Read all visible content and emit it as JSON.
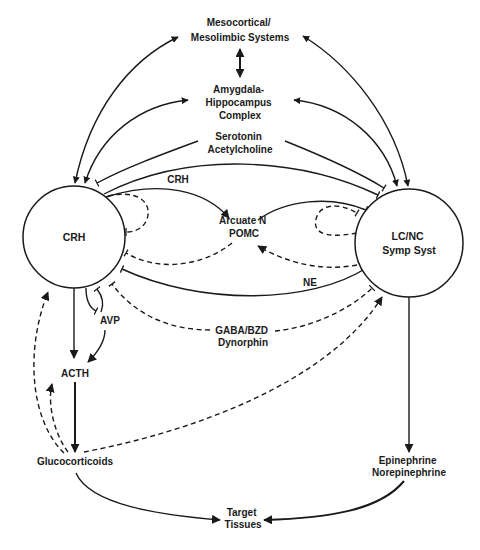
{
  "diagram": {
    "type": "stress-system-neuroendocrine-pathways",
    "nodes": {
      "mesocortical": {
        "lines": [
          "Mesocortical/",
          "Mesolimbic Systems"
        ]
      },
      "amygdala": {
        "lines": [
          "Amygdala-",
          "Hippocampus",
          "Complex"
        ]
      },
      "serotonin": {
        "lines": [
          "Serotonin",
          "Acetylcholine"
        ]
      },
      "crh_center": {
        "lines": [
          "CRH"
        ]
      },
      "lcnc": {
        "lines": [
          "LC/NC",
          "Symp Syst"
        ]
      },
      "arcuate": {
        "lines": [
          "Arcuate N",
          "POMC"
        ]
      },
      "gaba": {
        "lines": [
          "GABA/BZD",
          "Dynorphin"
        ]
      },
      "avp": {
        "lines": [
          "AVP"
        ]
      },
      "acth": {
        "lines": [
          "ACTH"
        ]
      },
      "glucocorticoids": {
        "lines": [
          "Glucocorticoids"
        ]
      },
      "epinephrine": {
        "lines": [
          "Epinephrine",
          "Norepinephrine"
        ]
      },
      "target": {
        "lines": [
          "Target",
          "Tissues"
        ]
      }
    },
    "edge_labels": {
      "crh": "CRH",
      "ne": "NE"
    },
    "edges": [
      {
        "from": "CRH",
        "to": "Mesocortical/Mesolimbic Systems",
        "style": "solid",
        "head": "arrow-both"
      },
      {
        "from": "CRH",
        "to": "Amygdala-Hippocampus Complex",
        "style": "solid",
        "head": "arrow-both"
      },
      {
        "from": "LC/NC Symp Syst",
        "to": "Mesocortical/Mesolimbic Systems",
        "style": "solid",
        "head": "arrow-both"
      },
      {
        "from": "LC/NC Symp Syst",
        "to": "Amygdala-Hippocampus Complex",
        "style": "solid",
        "head": "arrow-both"
      },
      {
        "from": "Mesocortical/Mesolimbic Systems",
        "to": "Amygdala-Hippocampus Complex",
        "style": "solid",
        "head": "arrow-both"
      },
      {
        "from": "Serotonin Acetylcholine",
        "to": "CRH",
        "style": "solid",
        "head": "stimulate"
      },
      {
        "from": "Serotonin Acetylcholine",
        "to": "LC/NC Symp Syst",
        "style": "solid",
        "head": "stimulate"
      },
      {
        "from": "CRH",
        "to": "LC/NC Symp Syst",
        "style": "solid",
        "head": "mutual"
      },
      {
        "from": "CRH",
        "to": "Arcuate N POMC",
        "label": "CRH",
        "style": "solid",
        "head": "arrow"
      },
      {
        "from": "Arcuate N POMC",
        "to": "CRH",
        "style": "dashed",
        "head": "inhibit"
      },
      {
        "from": "Arcuate N POMC",
        "to": "LC/NC Symp Syst",
        "style": "solid",
        "head": "inhibit"
      },
      {
        "from": "LC/NC Symp Syst",
        "to": "Arcuate N POMC",
        "label": "NE",
        "style": "dashed",
        "head": "arrow"
      },
      {
        "from": "LC/NC Symp Syst",
        "to": "CRH",
        "label": "NE",
        "style": "solid",
        "head": "inhibit"
      },
      {
        "from": "CRH",
        "to": "CRH",
        "style": "dashed",
        "head": "inhibit",
        "note": "ultrashort loop"
      },
      {
        "from": "LC/NC Symp Syst",
        "to": "LC/NC Symp Syst",
        "style": "dashed",
        "head": "inhibit",
        "note": "ultrashort loop"
      },
      {
        "from": "GABA/BZD Dynorphin",
        "to": "CRH",
        "style": "dashed",
        "head": "inhibit"
      },
      {
        "from": "GABA/BZD Dynorphin",
        "to": "LC/NC Symp Syst",
        "style": "dashed",
        "head": "inhibit"
      },
      {
        "from": "CRH",
        "to": "ACTH",
        "style": "solid",
        "head": "arrow"
      },
      {
        "from": "AVP",
        "to": "ACTH",
        "style": "solid",
        "head": "arrow"
      },
      {
        "from": "CRH",
        "to": "AVP",
        "style": "solid",
        "head": "inhibit"
      },
      {
        "from": "AVP",
        "to": "CRH",
        "style": "solid",
        "head": "inhibit"
      },
      {
        "from": "ACTH",
        "to": "Glucocorticoids",
        "style": "solid",
        "head": "arrow"
      },
      {
        "from": "Glucocorticoids",
        "to": "ACTH",
        "style": "dashed",
        "head": "arrow"
      },
      {
        "from": "Glucocorticoids",
        "to": "CRH",
        "style": "dashed",
        "head": "arrow"
      },
      {
        "from": "Glucocorticoids",
        "to": "LC/NC Symp Syst",
        "style": "dashed",
        "head": "arrow"
      },
      {
        "from": "LC/NC Symp Syst",
        "to": "Epinephrine Norepinephrine",
        "style": "solid",
        "head": "arrow"
      },
      {
        "from": "Glucocorticoids",
        "to": "Target Tissues",
        "style": "solid",
        "head": "arrow"
      },
      {
        "from": "Epinephrine Norepinephrine",
        "to": "Target Tissues",
        "style": "solid",
        "head": "arrow"
      }
    ]
  }
}
